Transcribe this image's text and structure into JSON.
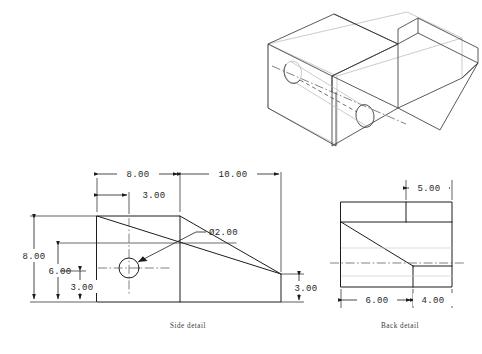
{
  "drawing": {
    "title": "Engineering part drawing",
    "units": "inches",
    "views": [
      {
        "id": "isometric",
        "label": "",
        "type": "isometric-pictorial"
      },
      {
        "id": "side",
        "label": "Side detail",
        "type": "orthographic-side"
      },
      {
        "id": "back",
        "label": "Back detail",
        "type": "orthographic-back"
      }
    ]
  },
  "side_view": {
    "label": "Side detail",
    "dimensions": {
      "top_left_width": "8.00",
      "top_right_width": "10.00",
      "hole_x_offset": "3.00",
      "overall_height": "8.00",
      "block_height": "6.00",
      "hole_center_height": "3.00",
      "right_end_height": "3.00",
      "hole_diameter": "Ø2.00"
    }
  },
  "back_view": {
    "label": "Back detail",
    "dimensions": {
      "top_notch_width": "5.00",
      "left_width": "6.00",
      "right_width": "4.00"
    }
  },
  "annotations": {
    "diameter_symbol": "Ø",
    "hole_callout": "Ø2.00"
  },
  "colors": {
    "line": "#1d1d1d",
    "iso_line": "#3c3c3c",
    "faint_line": "#b9b9b9",
    "center_line": "#4a4a4a",
    "background": "#ffffff",
    "text": "#262626"
  }
}
